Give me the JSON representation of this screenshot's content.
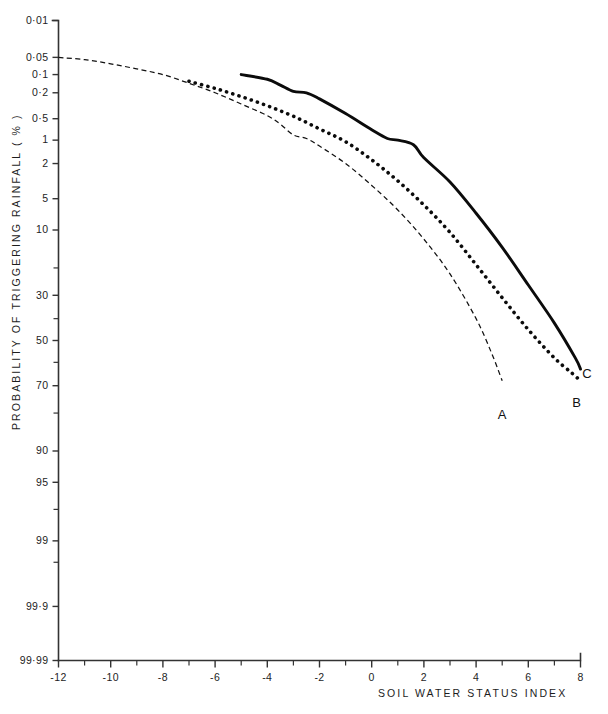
{
  "chart_data": {
    "type": "line",
    "title": "",
    "subtitle": "",
    "xlabel": "SOIL  WATER  STATUS  INDEX",
    "ylabel": "PROBABILITY  OF  TRIGGERING  RAINFALL   ( % )",
    "scale": "probability (normal probability paper) y-axis, linear x-axis",
    "grid": false,
    "legend_position": "inline curve labels at right end of each curve",
    "xlim": [
      -12,
      8
    ],
    "ylim": [
      0.01,
      99.99
    ],
    "x_ticks_major": [
      -12,
      -10,
      -8,
      -6,
      -4,
      -2,
      0,
      2,
      4,
      6,
      8
    ],
    "x_tick_labels": [
      "-12",
      "-10",
      "-8",
      "-6",
      "-4",
      "-2",
      "0",
      "2",
      "4",
      "6",
      "8"
    ],
    "x_ticks_minor": [
      -11,
      -9,
      -7,
      -5,
      -3,
      -1,
      1,
      3,
      5,
      7
    ],
    "y_ticks_major": [
      0.01,
      0.05,
      0.1,
      0.2,
      0.5,
      1,
      2,
      5,
      10,
      30,
      50,
      70,
      90,
      95,
      99,
      99.9,
      99.99
    ],
    "y_tick_labels": [
      "0·01",
      "0·05",
      "0·1",
      "0·2",
      "0·5",
      "1",
      "2",
      "5",
      "10",
      "30",
      "50",
      "70",
      "90",
      "95",
      "99",
      "99·9",
      "99·99"
    ],
    "y_ticks_minor": [
      20,
      40,
      60,
      80,
      97.5,
      99.5
    ],
    "series": [
      {
        "name": "A",
        "label": "A",
        "style": "fine dashed line",
        "color": "#111111",
        "points": [
          [
            -12.0,
            0.05
          ],
          [
            -11.0,
            0.055
          ],
          [
            -10.0,
            0.065
          ],
          [
            -9.0,
            0.08
          ],
          [
            -8.0,
            0.1
          ],
          [
            -7.0,
            0.14
          ],
          [
            -6.0,
            0.2
          ],
          [
            -5.0,
            0.3
          ],
          [
            -4.0,
            0.45
          ],
          [
            -3.5,
            0.6
          ],
          [
            -3.0,
            0.85
          ],
          [
            -2.5,
            0.95
          ],
          [
            -2.0,
            1.2
          ],
          [
            -1.0,
            2.0
          ],
          [
            0.0,
            3.6
          ],
          [
            1.0,
            6.5
          ],
          [
            2.0,
            12.0
          ],
          [
            3.0,
            22.0
          ],
          [
            4.0,
            40.0
          ],
          [
            4.6,
            56.0
          ],
          [
            5.0,
            68.0
          ]
        ]
      },
      {
        "name": "B",
        "label": "B",
        "style": "dotted line (round dots)",
        "color": "#0b0b0b",
        "points": [
          [
            -7.0,
            0.13
          ],
          [
            -6.0,
            0.17
          ],
          [
            -5.0,
            0.23
          ],
          [
            -4.0,
            0.32
          ],
          [
            -3.0,
            0.46
          ],
          [
            -2.0,
            0.7
          ],
          [
            -1.0,
            1.05
          ],
          [
            0.0,
            1.8
          ],
          [
            1.0,
            3.2
          ],
          [
            2.0,
            5.8
          ],
          [
            3.0,
            10.5
          ],
          [
            4.0,
            19.0
          ],
          [
            5.0,
            31.0
          ],
          [
            6.0,
            45.0
          ],
          [
            7.0,
            58.0
          ],
          [
            7.7,
            65.0
          ],
          [
            8.0,
            68.0
          ]
        ]
      },
      {
        "name": "C",
        "label": "C",
        "style": "thick solid line",
        "color": "#0b0b0b",
        "points": [
          [
            -5.0,
            0.1
          ],
          [
            -4.0,
            0.12
          ],
          [
            -3.5,
            0.15
          ],
          [
            -3.0,
            0.19
          ],
          [
            -2.5,
            0.2
          ],
          [
            -2.0,
            0.25
          ],
          [
            -1.0,
            0.42
          ],
          [
            0.0,
            0.72
          ],
          [
            0.6,
            0.95
          ],
          [
            1.0,
            1.0
          ],
          [
            1.6,
            1.15
          ],
          [
            2.0,
            1.7
          ],
          [
            3.0,
            3.3
          ],
          [
            4.0,
            7.0
          ],
          [
            5.0,
            14.0
          ],
          [
            6.0,
            26.0
          ],
          [
            7.0,
            42.0
          ],
          [
            7.8,
            58.0
          ],
          [
            8.0,
            63.0
          ]
        ]
      }
    ],
    "annotations": [
      {
        "text": "A",
        "x": 5.0,
        "y_pct": 82.0,
        "note": "label for dashed curve A"
      },
      {
        "text": "B",
        "x": 7.85,
        "y_pct": 78.0,
        "note": "label for dotted curve B"
      },
      {
        "text": "C",
        "x": 8.25,
        "y_pct": 67.0,
        "note": "label for solid curve C"
      }
    ]
  }
}
